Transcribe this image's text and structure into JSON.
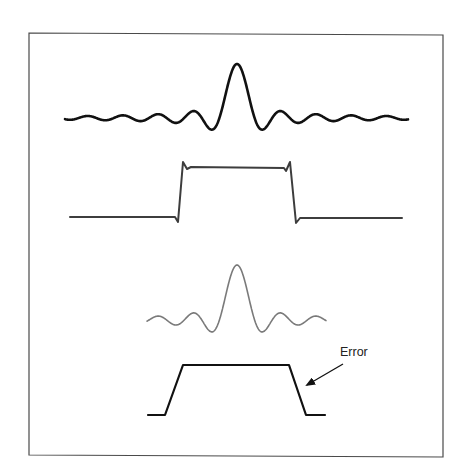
{
  "diagram": {
    "title": "",
    "frame": {
      "points": [
        [
          29,
          33
        ],
        [
          443,
          35
        ],
        [
          443,
          457
        ],
        [
          29,
          455
        ]
      ],
      "color": "#4a4a4a"
    },
    "curves": [
      {
        "id": "sinc-spectrum",
        "type": "sinc",
        "description": "Full sinc function (spectrum of ideal rectangle)",
        "x_start": 65,
        "x_end": 408,
        "center_x": 237,
        "baseline_y": 118,
        "peak_height": 54,
        "scale": 5.6,
        "color": "#111111",
        "stroke_width": 2.6
      },
      {
        "id": "rect-with-ringing",
        "type": "polyline",
        "description": "Rectangle reconstructed with Gibbs ringing at edges",
        "points": [
          [
            70,
            217
          ],
          [
            175,
            217
          ],
          [
            178,
            222
          ],
          [
            183,
            162
          ],
          [
            187,
            169
          ],
          [
            191,
            167
          ],
          [
            284,
            168
          ],
          [
            286,
            171
          ],
          [
            290,
            162
          ],
          [
            296,
            223
          ],
          [
            300,
            218
          ],
          [
            402,
            218
          ]
        ],
        "color": "#3d3d3d",
        "stroke_width": 2
      },
      {
        "id": "truncated-sinc",
        "type": "sinc",
        "description": "Truncated sinc function",
        "x_start": 147,
        "x_end": 326,
        "center_x": 237,
        "baseline_y": 320,
        "peak_height": 55,
        "scale": 5.6,
        "color": "#7a7a7a",
        "stroke_width": 1.6
      },
      {
        "id": "trapezoid-result",
        "type": "polyline",
        "description": "Resulting trapezoid with sloped edges (error)",
        "points": [
          [
            148,
            415
          ],
          [
            165,
            415
          ],
          [
            183,
            365
          ],
          [
            289,
            365
          ],
          [
            306,
            415
          ],
          [
            325,
            415
          ]
        ],
        "color": "#111111",
        "stroke_width": 2.2
      }
    ],
    "annotation": {
      "label": "Error",
      "label_x": 340,
      "label_y": 356,
      "arrow": {
        "from": [
          343,
          364
        ],
        "to": [
          307,
          385
        ],
        "color": "#111111"
      }
    }
  }
}
